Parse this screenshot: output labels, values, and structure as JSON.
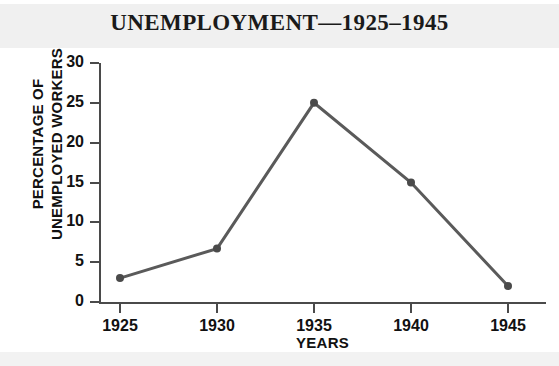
{
  "chart_data": {
    "type": "line",
    "title": "UNEMPLOYMENT—1925–1945",
    "xlabel": "YEARS",
    "ylabel_line1": "PERCENTAGE OF",
    "ylabel_line2": "UNEMPLOYED WORKERS",
    "categories": [
      "1925",
      "1930",
      "1935",
      "1940",
      "1945"
    ],
    "x": [
      1925,
      1930,
      1935,
      1940,
      1945
    ],
    "values": [
      3,
      6.7,
      25,
      15,
      2
    ],
    "xlim": [
      1925,
      1945
    ],
    "ylim": [
      0,
      30
    ],
    "ytick_labels": [
      "0",
      "5",
      "10",
      "15",
      "20",
      "25",
      "30"
    ],
    "ytick_values": [
      0,
      5,
      10,
      15,
      20,
      25,
      30
    ],
    "xtick_labels": [
      "1925",
      "1930",
      "1935",
      "1940",
      "1945"
    ],
    "grid": false,
    "legend": false,
    "series": [
      {
        "name": "Percentage of unemployed workers",
        "values": [
          3,
          6.7,
          25,
          15,
          2
        ]
      }
    ],
    "colors": {
      "line": "#5a5a5a",
      "marker": "#4a4a4a",
      "axis": "#4a4a4a",
      "text": "#111111",
      "title_text": "#1a1a1a",
      "plot_background": "#ffffff",
      "band": "#f0f0f0"
    }
  }
}
